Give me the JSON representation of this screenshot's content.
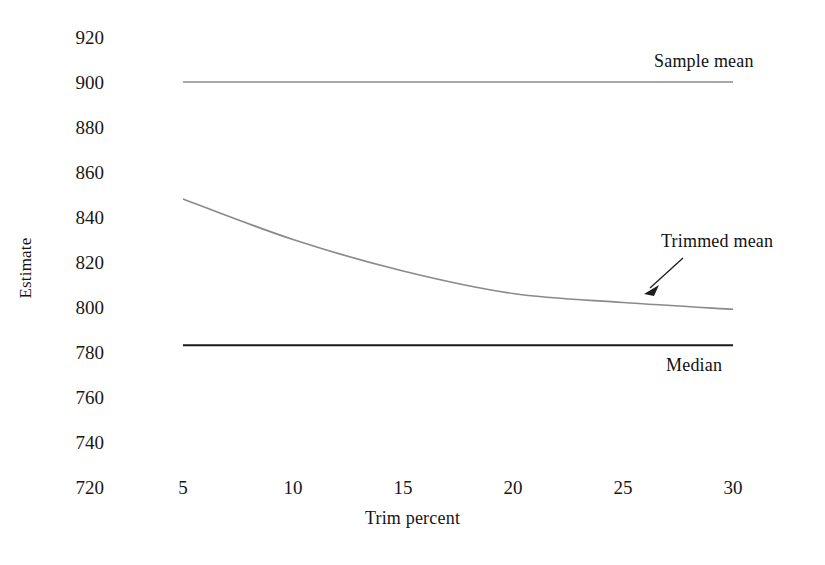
{
  "chart_data": {
    "type": "line",
    "title": "",
    "xlabel": "Trim percent",
    "ylabel": "Estimate",
    "xlim": [
      3.5,
      31.0
    ],
    "ylim": [
      720,
      920
    ],
    "xticks": [
      5,
      10,
      15,
      20,
      25,
      30
    ],
    "yticks": [
      720,
      740,
      760,
      780,
      800,
      820,
      840,
      860,
      880,
      900,
      920
    ],
    "grid": false,
    "legend": "inline-annotations",
    "series": [
      {
        "name": "Sample mean",
        "color": "#8a8a8a",
        "style": "flat-horizontal",
        "x": [
          5,
          10,
          15,
          20,
          25,
          30
        ],
        "values": [
          900,
          900,
          900,
          900,
          900,
          900
        ]
      },
      {
        "name": "Trimmed mean",
        "color": "#8a8a8a",
        "style": "decreasing-curve",
        "x": [
          5,
          10,
          15,
          20,
          25,
          30
        ],
        "values": [
          848,
          830,
          816,
          806,
          802,
          799
        ]
      },
      {
        "name": "Median",
        "color": "#1a1a1a",
        "style": "flat-horizontal",
        "x": [
          5,
          10,
          15,
          20,
          25,
          30
        ],
        "values": [
          783,
          783,
          783,
          783,
          783,
          783
        ]
      }
    ],
    "annotations": [
      {
        "text": "Sample mean",
        "target_series": "Sample mean",
        "placement": "above-right"
      },
      {
        "text": "Trimmed mean",
        "target_series": "Trimmed mean",
        "placement": "above-right",
        "arrow": true
      },
      {
        "text": "Median",
        "target_series": "Median",
        "placement": "below-right"
      }
    ]
  },
  "axes": {
    "y_title": "Estimate",
    "x_title": "Trim percent",
    "y_tick_labels": [
      "920",
      "900",
      "880",
      "860",
      "840",
      "820",
      "800",
      "780",
      "760",
      "740",
      "720"
    ],
    "x_tick_labels": [
      "5",
      "10",
      "15",
      "20",
      "25",
      "30"
    ]
  },
  "labels": {
    "sample_mean": "Sample mean",
    "trimmed_mean": "Trimmed mean",
    "median": "Median"
  },
  "caption": {
    "text": ""
  }
}
